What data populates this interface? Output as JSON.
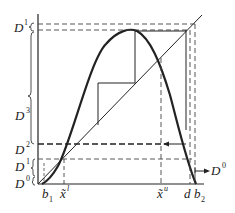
{
  "diagram": {
    "type": "cobweb map with unimodal curve and 45-degree line",
    "labels": {
      "D1_top": {
        "base": "D",
        "sup": "1"
      },
      "D3": {
        "base": "D",
        "sup": "3"
      },
      "D2": {
        "base": "D",
        "sup": "2"
      },
      "D1": {
        "base": "D",
        "sup": "1"
      },
      "D0": {
        "base": "D",
        "sup": "0"
      },
      "D0_arrow": {
        "base": "D",
        "sup": "0"
      },
      "b1": {
        "base": "b",
        "sub": "1"
      },
      "x_l": {
        "base": "x̃",
        "sup": "l"
      },
      "x_u": {
        "base": "x̃",
        "sup": "u"
      },
      "d": {
        "base": "d"
      },
      "b2": {
        "base": "b",
        "sub": "2"
      }
    },
    "colors": {
      "ink": "#222222",
      "background": "#ffffff"
    }
  }
}
